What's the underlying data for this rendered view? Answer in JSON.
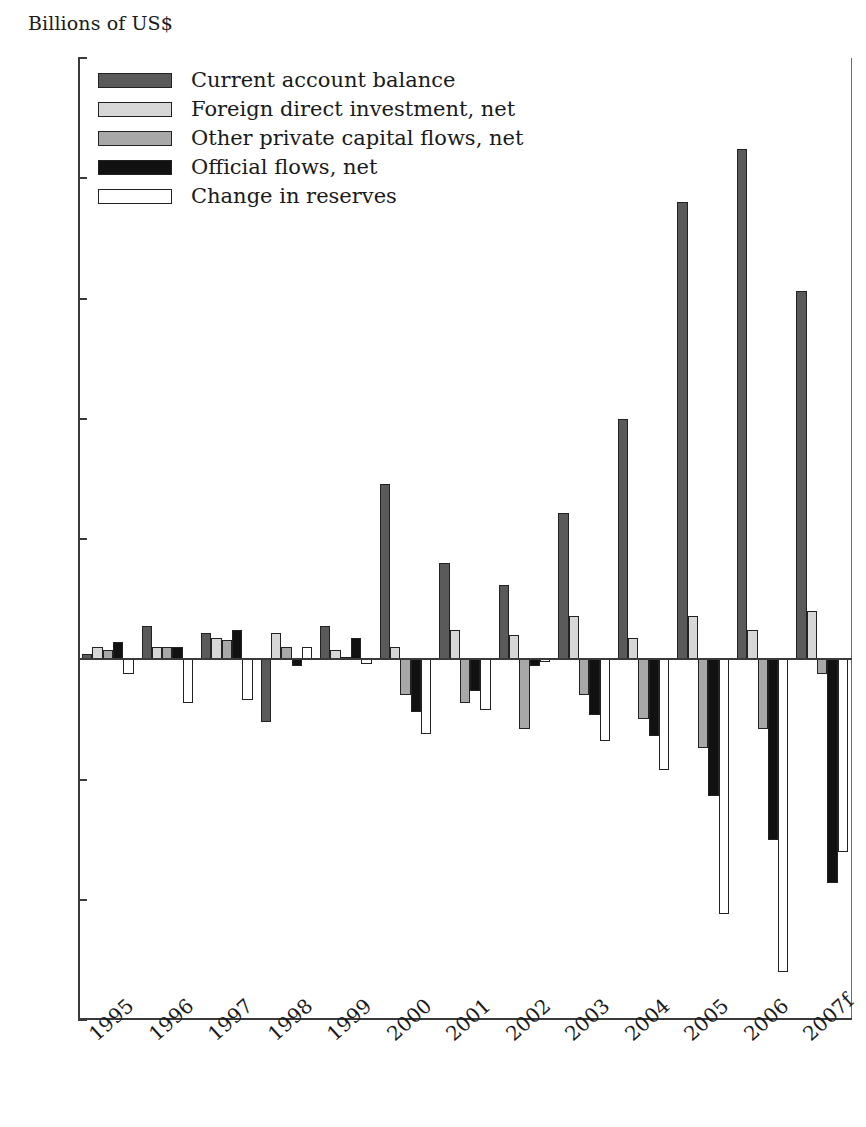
{
  "chart_data": {
    "type": "bar",
    "title": "",
    "subtitle": "",
    "ylabel": "Billions of US$",
    "xlabel": "",
    "ylim": [
      -150,
      250
    ],
    "yticks": [
      250,
      200,
      150,
      100,
      50,
      0,
      -50,
      -100,
      -150
    ],
    "ytick_labels": [
      "250",
      "200",
      "150",
      "100",
      "50",
      "0",
      "−50",
      "−100",
      "−150"
    ],
    "grid": false,
    "legend_position": "top-left",
    "categories": [
      "1995",
      "1996",
      "1997",
      "1998",
      "1999",
      "2000",
      "2001",
      "2002",
      "2003",
      "2004",
      "2005",
      "2006",
      "2007f"
    ],
    "series": [
      {
        "name": "Current account balance",
        "color": "#5a5a5a",
        "values": [
          2,
          14,
          11,
          -26,
          14,
          73,
          40,
          31,
          61,
          100,
          190,
          212,
          153
        ]
      },
      {
        "name": "Foreign direct investment, net",
        "color": "#d7d7d7",
        "values": [
          5,
          5,
          9,
          11,
          4,
          5,
          12,
          10,
          18,
          9,
          18,
          12,
          20
        ]
      },
      {
        "name": "Other private capital flows, net",
        "color": "#a8a8a8",
        "values": [
          4,
          5,
          8,
          5,
          1,
          -15,
          -18,
          -29,
          -15,
          -25,
          -37,
          -29,
          -6
        ]
      },
      {
        "name": "Official flows, net",
        "color": "#111111",
        "values": [
          7,
          5,
          12,
          -3,
          9,
          -22,
          -13,
          -3,
          -23,
          -32,
          -57,
          -75,
          -93
        ]
      },
      {
        "name": "Change in reserves",
        "color": "#ffffff",
        "values": [
          -6,
          -18,
          -17,
          5,
          -2,
          -31,
          -21,
          -1,
          -34,
          -46,
          -106,
          -130,
          -80
        ]
      }
    ]
  },
  "legend": {
    "items": [
      {
        "label": "Current account balance",
        "swatch": "s0"
      },
      {
        "label": "Foreign direct investment, net",
        "swatch": "s1"
      },
      {
        "label": "Other private capital flows, net",
        "swatch": "s2"
      },
      {
        "label": "Official flows, net",
        "swatch": "s3"
      },
      {
        "label": "Change in reserves",
        "swatch": "s4"
      }
    ]
  }
}
